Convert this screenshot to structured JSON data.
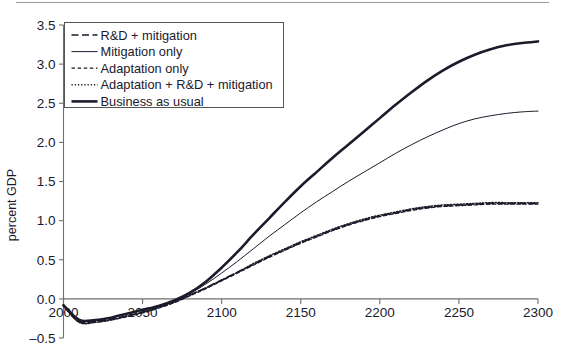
{
  "figure": {
    "title": "",
    "y_axis_title": "percent GDP"
  },
  "axes": {
    "y_ticks": [
      "3.5",
      "3.0",
      "2.5",
      "2.0",
      "1.5",
      "1.0",
      "0.5",
      "0.0",
      "–0.5"
    ],
    "y_tick_values": [
      3.5,
      3.0,
      2.5,
      2.0,
      1.5,
      1.0,
      0.5,
      0.0,
      -0.5
    ],
    "x_ticks": [
      "2000",
      "2050",
      "2100",
      "2150",
      "2200",
      "2250",
      "2300"
    ],
    "x_tick_values": [
      2000,
      2050,
      2100,
      2150,
      2200,
      2250,
      2300
    ]
  },
  "legend": {
    "position": "top-left-inside",
    "items": [
      {
        "label": "R&D + mitigation",
        "style": "long-dash",
        "width": 1.6
      },
      {
        "label": "Mitigation only",
        "style": "solid-thin",
        "width": 1.0
      },
      {
        "label": "Adaptation only",
        "style": "short-dash",
        "width": 1.2
      },
      {
        "label": "Adaptation + R&D + mitigation",
        "style": "dotted",
        "width": 1.4
      },
      {
        "label": "Business as usual",
        "style": "solid-thick",
        "width": 2.6
      }
    ]
  },
  "colors": {
    "line": "#1b1b2b",
    "axis": "#6f6f6f",
    "text": "#1a1a2e",
    "background": "#ffffff",
    "legend_border": "#555555"
  },
  "chart_data": {
    "type": "line",
    "title": "",
    "xlabel": "",
    "ylabel": "percent GDP",
    "xlim": [
      2000,
      2300
    ],
    "ylim": [
      -0.5,
      3.5
    ],
    "grid": false,
    "legend_position": "upper left",
    "x": [
      2000,
      2010,
      2020,
      2030,
      2040,
      2050,
      2060,
      2070,
      2080,
      2090,
      2100,
      2110,
      2120,
      2130,
      2140,
      2150,
      2160,
      2170,
      2180,
      2190,
      2200,
      2210,
      2220,
      2230,
      2240,
      2250,
      2260,
      2270,
      2280,
      2290,
      2300
    ],
    "series": [
      {
        "name": "Business as usual",
        "style": "solid-thick",
        "values": [
          -0.08,
          -0.27,
          -0.27,
          -0.24,
          -0.19,
          -0.14,
          -0.09,
          -0.02,
          0.08,
          0.22,
          0.4,
          0.6,
          0.82,
          1.03,
          1.24,
          1.44,
          1.62,
          1.8,
          1.97,
          2.14,
          2.31,
          2.48,
          2.64,
          2.79,
          2.92,
          3.03,
          3.12,
          3.19,
          3.24,
          3.27,
          3.29
        ]
      },
      {
        "name": "Mitigation only",
        "style": "solid-thin",
        "values": [
          -0.08,
          -0.27,
          -0.27,
          -0.24,
          -0.19,
          -0.14,
          -0.09,
          -0.02,
          0.07,
          0.19,
          0.33,
          0.48,
          0.64,
          0.8,
          0.95,
          1.1,
          1.24,
          1.37,
          1.5,
          1.62,
          1.74,
          1.86,
          1.97,
          2.07,
          2.16,
          2.24,
          2.3,
          2.34,
          2.37,
          2.39,
          2.4
        ]
      },
      {
        "name": "R&D + mitigation",
        "style": "long-dash",
        "values": [
          -0.09,
          -0.29,
          -0.29,
          -0.26,
          -0.22,
          -0.17,
          -0.11,
          -0.04,
          0.05,
          0.14,
          0.24,
          0.34,
          0.44,
          0.54,
          0.63,
          0.72,
          0.8,
          0.88,
          0.95,
          1.01,
          1.06,
          1.1,
          1.14,
          1.17,
          1.19,
          1.2,
          1.21,
          1.22,
          1.22,
          1.22,
          1.22
        ]
      },
      {
        "name": "Adaptation only",
        "style": "short-dash",
        "values": [
          -0.09,
          -0.3,
          -0.3,
          -0.27,
          -0.23,
          -0.18,
          -0.12,
          -0.05,
          0.04,
          0.13,
          0.23,
          0.33,
          0.43,
          0.53,
          0.62,
          0.71,
          0.79,
          0.87,
          0.94,
          1.0,
          1.05,
          1.09,
          1.13,
          1.16,
          1.18,
          1.19,
          1.2,
          1.21,
          1.21,
          1.21,
          1.21
        ]
      },
      {
        "name": "Adaptation + R&D + mitigation",
        "style": "dotted",
        "values": [
          -0.09,
          -0.3,
          -0.3,
          -0.27,
          -0.22,
          -0.17,
          -0.11,
          -0.04,
          0.05,
          0.14,
          0.24,
          0.34,
          0.45,
          0.55,
          0.64,
          0.73,
          0.81,
          0.89,
          0.96,
          1.02,
          1.07,
          1.11,
          1.15,
          1.18,
          1.2,
          1.21,
          1.22,
          1.23,
          1.23,
          1.23,
          1.23
        ]
      }
    ]
  }
}
